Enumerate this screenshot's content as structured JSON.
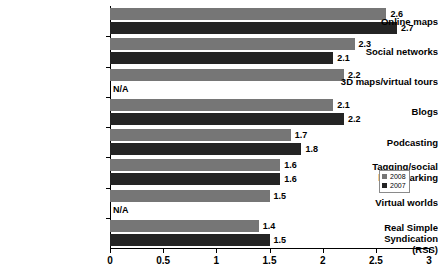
{
  "chart_data": {
    "type": "bar",
    "orientation": "horizontal",
    "title": "",
    "subtitle": "",
    "xlabel": "",
    "ylabel": "",
    "xlim": [
      0,
      3
    ],
    "xticks": [
      "0",
      "0.5",
      "1",
      "1.5",
      "2",
      "2.5",
      "3"
    ],
    "xtick_values": [
      0,
      0.5,
      1,
      1.5,
      2,
      2.5,
      3
    ],
    "grid": false,
    "legend_position": "right",
    "na_text": "N/A",
    "categories": [
      "Online maps",
      "Social networks",
      "3D maps/virtual tours",
      "Blogs",
      "Podcasting",
      "Tagging/social bookmarking",
      "Virtual worlds",
      "Real Simple Syndication (RSS)"
    ],
    "series": [
      {
        "name": "2008",
        "color": "#767676",
        "values": [
          2.6,
          2.3,
          2.2,
          2.1,
          1.7,
          1.6,
          1.5,
          1.4
        ],
        "labels": [
          "2.6",
          "2.3",
          "2.2",
          "2.1",
          "1.7",
          "1.6",
          "1.5",
          "1.4"
        ]
      },
      {
        "name": "2007",
        "color": "#242424",
        "values": [
          2.7,
          2.1,
          null,
          2.2,
          1.8,
          1.6,
          null,
          1.5
        ],
        "labels": [
          "2.7",
          "2.1",
          "N/A",
          "2.2",
          "1.8",
          "1.6",
          "N/A",
          "1.5"
        ]
      }
    ]
  },
  "legend": {
    "items": [
      {
        "label": "2008",
        "color": "#767676"
      },
      {
        "label": "2007",
        "color": "#242424"
      }
    ]
  },
  "axis": {
    "ticks": [
      {
        "label": "0"
      },
      {
        "label": "0.5"
      },
      {
        "label": "1"
      },
      {
        "label": "1.5"
      },
      {
        "label": "2"
      },
      {
        "label": "2.5"
      },
      {
        "label": "3"
      }
    ]
  },
  "rows": [
    {
      "category": "Online maps",
      "v2008": "2.6",
      "v2007": "2.7"
    },
    {
      "category": "Social networks",
      "v2008": "2.3",
      "v2007": "2.1"
    },
    {
      "category": "3D maps/virtual tours",
      "v2008": "2.2",
      "v2007": "N/A"
    },
    {
      "category": "Blogs",
      "v2008": "2.1",
      "v2007": "2.2"
    },
    {
      "category": "Podcasting",
      "v2008": "1.7",
      "v2007": "1.8"
    },
    {
      "category": "Tagging/social bookmarking",
      "v2008": "1.6",
      "v2007": "1.6"
    },
    {
      "category": "Virtual worlds",
      "v2008": "1.5",
      "v2007": "N/A"
    },
    {
      "category": "Real Simple Syndication (RSS)",
      "v2008": "1.4",
      "v2007": "1.5"
    }
  ]
}
